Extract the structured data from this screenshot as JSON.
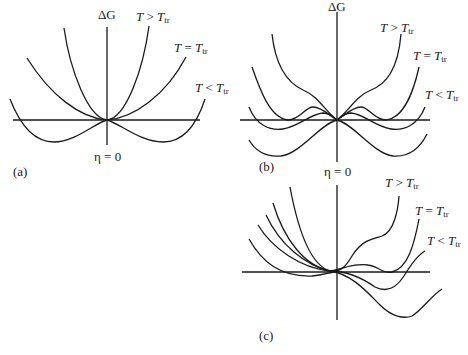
{
  "figure": {
    "panels": [
      {
        "id": "a",
        "caption": "(a)",
        "y_axis_label": "ΔG",
        "x_origin_label": "η = 0",
        "curves": [
          {
            "label_T": "T",
            "label_rel": ">",
            "label_Ttr": "T",
            "label_sub": "tr",
            "description": "single minimum at η=0 (steep parabola)"
          },
          {
            "label_T": "T",
            "label_rel": "=",
            "label_Ttr": "T",
            "label_sub": "tr",
            "description": "flat quartic minimum at η=0"
          },
          {
            "label_T": "T",
            "label_rel": "<",
            "label_Ttr": "T",
            "label_sub": "tr",
            "description": "double well, symmetric minima at ±η"
          }
        ]
      },
      {
        "id": "b",
        "caption": "(b)",
        "y_axis_label": "ΔG",
        "x_origin_label": "η = 0",
        "curves": [
          {
            "label_T": "T",
            "label_rel": ">",
            "label_Ttr": "T",
            "label_sub": "tr"
          },
          {
            "label_T": "T",
            "label_rel": "=",
            "label_Ttr": "T",
            "label_sub": "tr"
          },
          {
            "label_T": "T",
            "label_rel": "<",
            "label_Ttr": "T",
            "label_sub": "tr"
          }
        ]
      },
      {
        "id": "c",
        "caption": "(c)",
        "curves": [
          {
            "label_T": "T",
            "label_rel": ">",
            "label_Ttr": "T",
            "label_sub": "tr"
          },
          {
            "label_T": "T",
            "label_rel": "=",
            "label_Ttr": "T",
            "label_sub": "tr"
          },
          {
            "label_T": "T",
            "label_rel": "<",
            "label_Ttr": "T",
            "label_sub": "tr"
          }
        ]
      }
    ]
  }
}
